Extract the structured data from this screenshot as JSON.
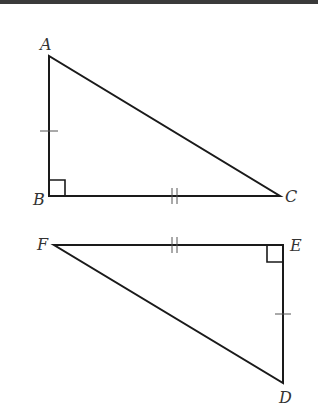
{
  "diagram": {
    "type": "congruent right triangles",
    "triangles": [
      {
        "name": "triangle-ABC",
        "vertices": [
          {
            "label": "A",
            "x": 49,
            "y": 56,
            "lx": 40,
            "ly": 50
          },
          {
            "label": "B",
            "x": 49,
            "y": 196,
            "lx": 33,
            "ly": 205
          },
          {
            "label": "C",
            "x": 280,
            "y": 196,
            "lx": 285,
            "ly": 202
          }
        ],
        "right_angle_at": "B",
        "marks": [
          {
            "segment": "AB",
            "ticks": 1
          },
          {
            "segment": "BC",
            "ticks": 2
          }
        ]
      },
      {
        "name": "triangle-DEF",
        "vertices": [
          {
            "label": "F",
            "x": 54,
            "y": 245,
            "lx": 37,
            "ly": 250
          },
          {
            "label": "E",
            "x": 283,
            "y": 245,
            "lx": 290,
            "ly": 251
          },
          {
            "label": "D",
            "x": 283,
            "y": 383,
            "lx": 279,
            "ly": 403
          }
        ],
        "right_angle_at": "E",
        "marks": [
          {
            "segment": "FE",
            "ticks": 2
          },
          {
            "segment": "ED",
            "ticks": 1
          }
        ]
      }
    ]
  },
  "colors": {
    "line": "#1a1a1a",
    "label": "#333333",
    "topbar": "#3a3a3a",
    "background": "#ffffff"
  }
}
